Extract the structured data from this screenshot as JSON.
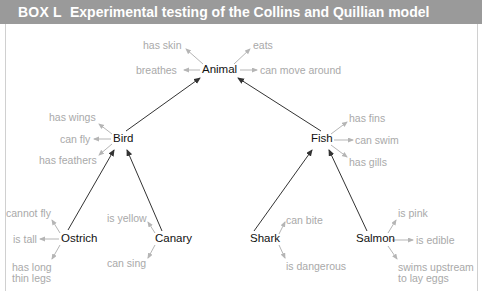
{
  "header": {
    "box_label": "BOX L",
    "title": "Experimental testing of the Collins and Quillian model",
    "background": "#9a9a9a"
  },
  "nodes": {
    "animal": {
      "label": "Animal"
    },
    "bird": {
      "label": "Bird"
    },
    "fish": {
      "label": "Fish"
    },
    "ostrich": {
      "label": "Ostrich"
    },
    "canary": {
      "label": "Canary"
    },
    "shark": {
      "label": "Shark"
    },
    "salmon": {
      "label": "Salmon"
    }
  },
  "properties": {
    "animal": [
      "has skin",
      "eats",
      "breathes",
      "can move around"
    ],
    "bird": [
      "has wings",
      "can fly",
      "has feathers"
    ],
    "fish": [
      "has fins",
      "can swim",
      "has gills"
    ],
    "ostrich": [
      "cannot fly",
      "is tall",
      "has long",
      "thin legs"
    ],
    "canary": [
      "is yellow",
      "can sing"
    ],
    "shark": [
      "can bite",
      "is dangerous"
    ],
    "salmon": [
      "is pink",
      "is edible",
      "swims upstream",
      "to lay eggs"
    ]
  },
  "hierarchy_links": [
    {
      "from": "Bird",
      "to": "Animal"
    },
    {
      "from": "Fish",
      "to": "Animal"
    },
    {
      "from": "Ostrich",
      "to": "Bird"
    },
    {
      "from": "Canary",
      "to": "Bird"
    },
    {
      "from": "Shark",
      "to": "Fish"
    },
    {
      "from": "Salmon",
      "to": "Fish"
    }
  ],
  "colors": {
    "node_text": "#111111",
    "property_text": "#a9a9a9",
    "hierarchy_arrow": "#333333",
    "property_arrow": "#b5b5b5"
  }
}
